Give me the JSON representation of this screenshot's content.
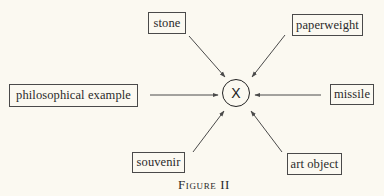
{
  "figure": {
    "caption": "Figure II",
    "center_node": {
      "label": "X"
    },
    "nodes": [
      {
        "id": "stone",
        "label": "stone",
        "position": "top-left"
      },
      {
        "id": "paperweight",
        "label": "paperweight",
        "position": "top-right"
      },
      {
        "id": "philosophical-example",
        "label": "philosophical example",
        "position": "left"
      },
      {
        "id": "missile",
        "label": "missile",
        "position": "right"
      },
      {
        "id": "souvenir",
        "label": "souvenir",
        "position": "bottom-left"
      },
      {
        "id": "art-object",
        "label": "art object",
        "position": "bottom-right"
      }
    ],
    "edges": [
      {
        "from": "stone",
        "to": "X"
      },
      {
        "from": "paperweight",
        "to": "X"
      },
      {
        "from": "philosophical-example",
        "to": "X"
      },
      {
        "from": "missile",
        "to": "X"
      },
      {
        "from": "souvenir",
        "to": "X"
      },
      {
        "from": "art-object",
        "to": "X"
      }
    ],
    "colors": {
      "background": "#fbf9f1",
      "line": "#4a4a4a",
      "text": "#2a2a2a"
    }
  }
}
